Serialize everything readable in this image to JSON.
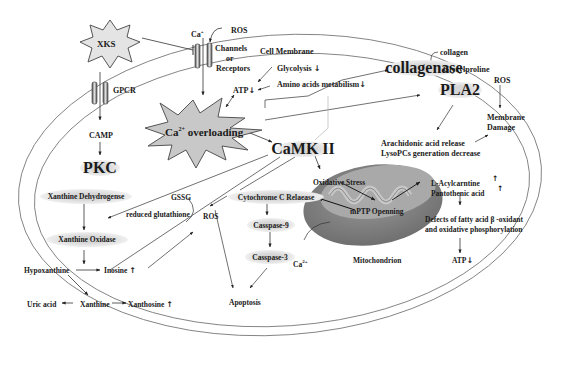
{
  "diagram": {
    "stimulus": "XKS",
    "membrane": {
      "label": "Cell Membrane",
      "channel_ion": "Ca",
      "channel_ion_sub": "2",
      "channel_ion_sup": "+",
      "channel_label_1": "Channels",
      "channel_label_2": "or",
      "channel_label_3": "Receptors",
      "ros_top": "ROS",
      "gpcr": "GPCR"
    },
    "metabolism": {
      "glycolysis": "Glycolysis",
      "glycolysis_dir": "↓",
      "amino_acids": "Amino acids metabilism",
      "amino_acids_dir": "↓",
      "atp": "ATP",
      "atp_dir": "↓"
    },
    "ca_overload": {
      "prefix": "Ca",
      "sup": "2+",
      "suffix": " overloading"
    },
    "collagen": {
      "collagenase": "collagenase",
      "collagen": "collagen",
      "glycylproline": "Glycylproline"
    },
    "pla2": {
      "label": "PLA2",
      "ros": "ROS",
      "membrane_damage_1": "Membrane",
      "membrane_damage_2": "Damage",
      "arachidonic": "Arachidonic acid release",
      "lysopcs": "LysoPCs generation decrease"
    },
    "camp_pathway": {
      "camp": "CAMP",
      "pkc": "PKC"
    },
    "camk": "CaMK II",
    "purine": {
      "xanthine_dehydrogenase": "Xanthine Dehydrogense",
      "xanthine_oxidase": "Xanthine Oxidase",
      "hypoxanthine": "Hypoxanthine",
      "inosine": "Inosine",
      "inosine_dir": "↑",
      "uric_acid": "Uric acid",
      "xanthine": "Xanthine",
      "xanthosine": "Xanthosine",
      "xanthosine_dir": "↑"
    },
    "glutathione": {
      "gssg": "GSSG",
      "reduced": "reduced glutathione",
      "ros": "ROS"
    },
    "apoptosis": {
      "cytochrome": "Cytochrome C Relaease",
      "caspase9": "Casspase-9",
      "caspase3": "Casspase-3",
      "apoptosis": "Apoptosis",
      "ca_prefix": "Ca",
      "ca_sup": "2+"
    },
    "mitochondrion": {
      "label": "Mitochondrion",
      "oxidative_stress": "Oxidative Stress",
      "mptp": "mPTP Openning",
      "acylcarnitine": "L-Acylcarntine",
      "pantothenic": "Pantothenic acid",
      "up_dir": "↑",
      "defects_1": "Defects of fatty acid β -oxidant",
      "defects_2": "and oxidative phosphorylation",
      "atp": "ATP",
      "atp_dir": "↓"
    }
  },
  "colors": {
    "line": "#333333",
    "membrane": "#777777",
    "star_fill": "#c8c8c8",
    "mito_outer": "#8a8a8a",
    "mito_inner": "#b4b4b4",
    "pill": "#d6d6d6"
  }
}
